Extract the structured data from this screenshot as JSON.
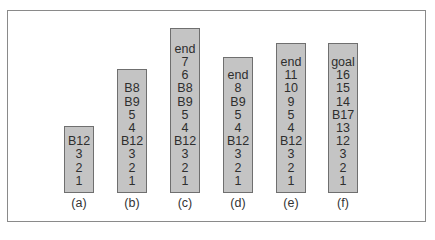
{
  "figure": {
    "stacks": [
      {
        "label": "(a)",
        "items_top_to_bottom": [
          "B12",
          "3",
          "2",
          "1"
        ]
      },
      {
        "label": "(b)",
        "items_top_to_bottom": [
          "B8",
          "B9",
          "5",
          "4",
          "B12",
          "3",
          "2",
          "1"
        ]
      },
      {
        "label": "(c)",
        "items_top_to_bottom": [
          "end",
          "7",
          "6",
          "B8",
          "B9",
          "5",
          "4",
          "B12",
          "3",
          "2",
          "1"
        ]
      },
      {
        "label": "(d)",
        "items_top_to_bottom": [
          "end",
          "8",
          "B9",
          "5",
          "4",
          "B12",
          "3",
          "2",
          "1"
        ]
      },
      {
        "label": "(e)",
        "items_top_to_bottom": [
          "end",
          "11",
          "10",
          "9",
          "5",
          "4",
          "B12",
          "3",
          "2",
          "1"
        ]
      },
      {
        "label": "(f)",
        "items_top_to_bottom": [
          "goal",
          "16",
          "15",
          "14",
          "B17",
          "13",
          "12",
          "3",
          "2",
          "1"
        ]
      }
    ],
    "colors": {
      "stack_fill": "#c4c4c4",
      "stack_border": "#6f6f6f",
      "frame_border": "#8a8a8a",
      "text": "#2e2e2e"
    }
  }
}
